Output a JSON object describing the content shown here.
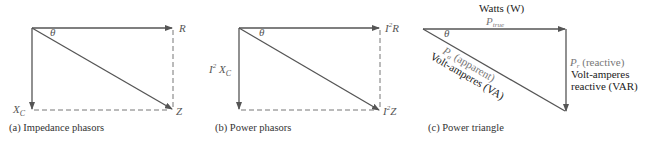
{
  "panels": [
    {
      "id": "a",
      "caption": "(a) Impedance phasors",
      "angle": "θ",
      "labels": {
        "horizontal": "R",
        "vertical": "X",
        "vertical_sub": "C",
        "diagonal": "Z"
      }
    },
    {
      "id": "b",
      "caption": "(b) Power phasors",
      "angle": "θ",
      "labels": {
        "horizontal_base": "I",
        "horizontal_sup": "2",
        "horizontal_tail": "R",
        "vertical_base": "I",
        "vertical_sup": "2",
        "vertical_tail": " X",
        "vertical_sub": "C",
        "diagonal_base": "I",
        "diagonal_sup": "2",
        "diagonal_tail": "Z"
      }
    },
    {
      "id": "c",
      "caption": "(c) Power triangle",
      "angle": "θ",
      "top_unit": "Watts (W)",
      "true_power": {
        "symbol": "P",
        "sub": "true"
      },
      "reactive_power": {
        "symbol": "P",
        "sub": "r",
        "desc": " (reactive)",
        "unit_line1": "Volt-amperes",
        "unit_line2": "reactive (VAR)"
      },
      "apparent_power": {
        "symbol": "P",
        "sub": "a",
        "desc": " (apparent)",
        "unit": "Volt-amperes (VA)"
      }
    }
  ],
  "colors": {
    "line": "#555555",
    "dashed": "#777777",
    "text": "#222222",
    "label": "#666666"
  }
}
